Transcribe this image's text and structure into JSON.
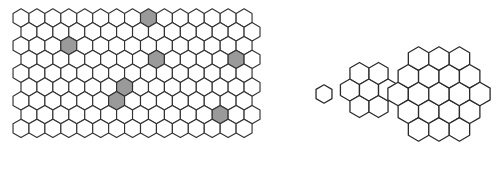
{
  "figure": {
    "width": 497,
    "height": 188,
    "background_color": "#ffffff"
  },
  "colors": {
    "cell_stroke": "#333333",
    "cell_fill": "#ffffff",
    "shaded_fill": "#9a9a9a",
    "cluster_stroke": "#2b2b2b",
    "cluster_fill": "#ffffff"
  },
  "lattice": {
    "name": "honeycomb-grid",
    "orientation": "pointy-top",
    "columns": 15,
    "rows": 9,
    "hex_radius": 9.2,
    "origin_x": 21,
    "origin_y": 18,
    "shaded_cells": [
      {
        "col": 8,
        "row": 0
      },
      {
        "col": 3,
        "row": 2
      },
      {
        "col": 8,
        "row": 3
      },
      {
        "col": 13,
        "row": 3
      },
      {
        "col": 6,
        "row": 5
      },
      {
        "col": 6,
        "row": 6
      },
      {
        "col": 12,
        "row": 7
      }
    ],
    "shaded_count": 7
  },
  "clusters": [
    {
      "name": "cluster-ring-0",
      "label": "single",
      "ring": 0,
      "hex_count": 1,
      "center_x": 324,
      "center_y": 94,
      "hex_radius": 9.2
    },
    {
      "name": "cluster-ring-1",
      "label": "flower",
      "ring": 1,
      "hex_count": 7,
      "center_x": 369,
      "center_y": 90,
      "hex_radius": 11.0
    },
    {
      "name": "cluster-ring-2",
      "label": "double-flower",
      "ring": 2,
      "hex_count": 19,
      "center_x": 439,
      "center_y": 94,
      "hex_radius": 11.8
    }
  ]
}
